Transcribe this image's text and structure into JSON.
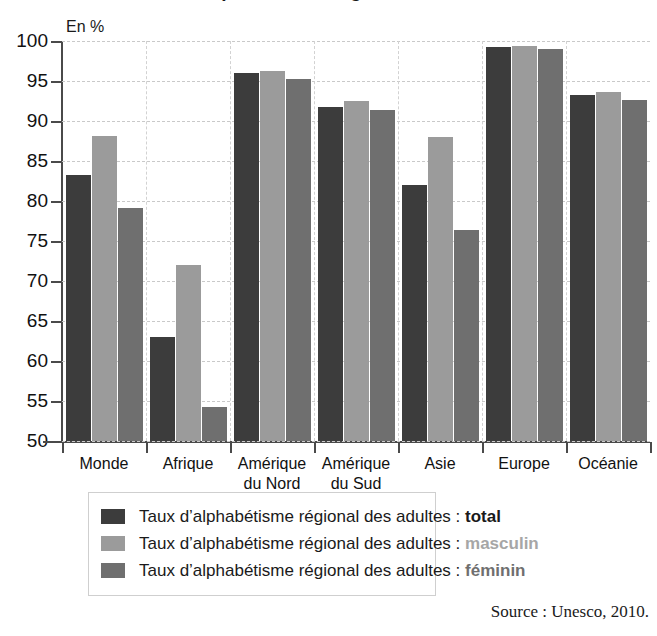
{
  "title_partial": "Taux d'alphabétisme régional des adultes",
  "axis_unit": "En %",
  "source": "Source : Unesco, 2010.",
  "legend": {
    "prefix": "Taux d’alphabétisme régional des adultes : ",
    "items": [
      {
        "kind": "total",
        "color": "#3c3c3c",
        "swatch_name": "legend-swatch-total"
      },
      {
        "kind": "masculin",
        "color": "#9b9b9b",
        "swatch_name": "legend-swatch-masculin"
      },
      {
        "kind": "féminin",
        "color": "#6f6f6f",
        "swatch_name": "legend-swatch-feminin"
      }
    ]
  },
  "chart_data": {
    "type": "bar",
    "title": "Taux d'alphabétisme régional des adultes",
    "xlabel": "",
    "ylabel": "En %",
    "ylim": [
      50,
      100
    ],
    "yticks": [
      50,
      55,
      60,
      65,
      70,
      75,
      80,
      85,
      90,
      95,
      100
    ],
    "grid": true,
    "legend_position": "bottom",
    "categories": [
      "Monde",
      "Afrique",
      "Amérique\ndu Nord",
      "Amérique\ndu Sud",
      "Asie",
      "Europe",
      "Océanie"
    ],
    "series": [
      {
        "name": "total",
        "color": "#3c3c3c",
        "values": [
          83.2,
          63.0,
          96.0,
          91.8,
          82.0,
          99.3,
          93.2
        ]
      },
      {
        "name": "masculin",
        "color": "#9b9b9b",
        "values": [
          88.1,
          72.0,
          96.3,
          92.5,
          88.0,
          99.4,
          93.6
        ]
      },
      {
        "name": "féminin",
        "color": "#6f6f6f",
        "values": [
          79.1,
          54.3,
          95.2,
          91.4,
          76.4,
          99.0,
          92.6
        ]
      }
    ]
  }
}
